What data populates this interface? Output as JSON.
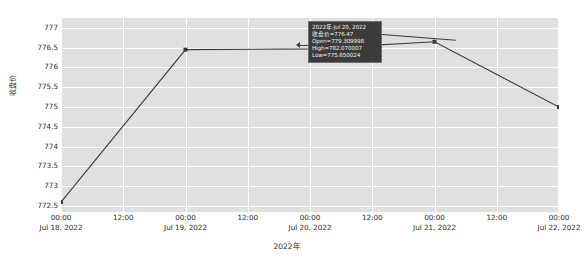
{
  "chart_data": {
    "type": "line",
    "title": "",
    "xlabel": "2022年",
    "ylabel": "收盘价",
    "ylim": [
      772.35,
      777.25
    ],
    "grid": true,
    "legend": null,
    "categories": [
      "Jul 18, 2022",
      "Jul 19, 2022",
      "Jul 20, 2022",
      "Jul 21, 2022",
      "Jul 22, 2022"
    ],
    "x": [
      0,
      1,
      2,
      3,
      4
    ],
    "values": [
      772.6,
      776.45,
      776.47,
      776.65,
      775.0
    ],
    "series": [
      {
        "name": "收盘价",
        "color": "#3a3a3a",
        "marker": "square",
        "values": [
          772.6,
          776.45,
          776.47,
          776.65,
          775.0
        ]
      }
    ],
    "yticks": [
      777,
      776.5,
      776,
      775.5,
      775,
      774.5,
      774,
      773.5,
      773,
      772.5
    ],
    "ytick_labels": [
      "777",
      "776.5",
      "776",
      "775.5",
      "775",
      "774.5",
      "774",
      "773.5",
      "773",
      "772.5"
    ],
    "xticks": [
      {
        "time": "00:00",
        "date": "Jul 18, 2022",
        "pos": 0.0
      },
      {
        "time": "12:00",
        "date": "",
        "pos": 0.125
      },
      {
        "time": "00:00",
        "date": "Jul 19, 2022",
        "pos": 0.25
      },
      {
        "time": "12:00",
        "date": "",
        "pos": 0.375
      },
      {
        "time": "00:00",
        "date": "Jul 20, 2022",
        "pos": 0.5
      },
      {
        "time": "12:00",
        "date": "",
        "pos": 0.625
      },
      {
        "time": "00:00",
        "date": "Jul 21, 2022",
        "pos": 0.75
      },
      {
        "time": "12:00",
        "date": "",
        "pos": 0.875
      },
      {
        "time": "00:00",
        "date": "Jul 22, 2022",
        "pos": 1.0
      }
    ],
    "annotation": {
      "target_index": 2,
      "lines": [
        "2022年-Jul 20, 2022",
        "收盘价=776.47",
        "Open=779.309998",
        "High=782.070007",
        "Low=775.650024"
      ]
    }
  },
  "style": {
    "figure_bg": "#ffffff",
    "axes_bg": "#e0e0e0",
    "grid_color": "#ffffff",
    "line_color": "#3a3a3a",
    "text_color": "#2b2b2b",
    "tooltip_bg": "#3b3b3b",
    "tooltip_text": "#f0f0f0",
    "tooltip_border": "#6f6f6f"
  }
}
